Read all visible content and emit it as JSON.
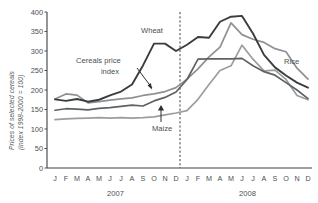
{
  "chart_data": {
    "type": "line",
    "title": "",
    "ylabel_line1": "Prices of selected cereals",
    "ylabel_line2": "(index 1998-2000 = 100)",
    "xlabel": "",
    "ylim": [
      0,
      400
    ],
    "yticks": [
      0,
      50,
      100,
      150,
      200,
      250,
      300,
      350,
      400
    ],
    "ytick_labels": [
      "0",
      "50",
      "100",
      "150",
      "200",
      "250",
      "300",
      "350",
      "400"
    ],
    "grid": false,
    "legend_position": "inline-annotations",
    "x": [
      "J",
      "F",
      "M",
      "A",
      "M",
      "J",
      "J",
      "A",
      "S",
      "O",
      "N",
      "D",
      "J",
      "F",
      "M",
      "A",
      "M",
      "J",
      "J",
      "A",
      "S",
      "O",
      "N",
      "D"
    ],
    "year_groups": [
      {
        "label": "2007",
        "start_index": 0,
        "end_index": 11
      },
      {
        "label": "2008",
        "start_index": 12,
        "end_index": 23
      }
    ],
    "annotations": [
      {
        "id": "wheat-label",
        "text": "Wheat"
      },
      {
        "id": "cereals-price-index-label",
        "text": "Cereals price index"
      },
      {
        "id": "maize-label",
        "text": "Maize"
      },
      {
        "id": "rice-label",
        "text": "Rice"
      },
      {
        "id": "year-divider",
        "text": ""
      }
    ],
    "series": [
      {
        "name": "Wheat",
        "color": "#3a3d3f",
        "values": [
          176,
          172,
          177,
          170,
          175,
          186,
          196,
          214,
          263,
          319,
          319,
          300,
          316,
          336,
          334,
          375,
          388,
          390,
          345,
          290,
          258,
          237,
          219,
          206
        ]
      },
      {
        "name": "Rice",
        "color": "#8e9092",
        "values": [
          177,
          190,
          187,
          167,
          170,
          174,
          177,
          180,
          186,
          190,
          196,
          206,
          228,
          254,
          285,
          310,
          372,
          342,
          330,
          322,
          306,
          298,
          256,
          228
        ]
      },
      {
        "name": "Cereals price index",
        "color": "#5e6264",
        "values": [
          148,
          152,
          151,
          149,
          153,
          155,
          158,
          161,
          159,
          172,
          181,
          195,
          227,
          279,
          280,
          280,
          280,
          281,
          262,
          247,
          238,
          219,
          200,
          178
        ]
      },
      {
        "name": "Maize",
        "color": "#9b9d9f",
        "values": [
          124,
          126,
          127,
          128,
          129,
          128,
          129,
          128,
          129,
          131,
          136,
          141,
          147,
          176,
          214,
          250,
          262,
          315,
          279,
          249,
          251,
          227,
          186,
          175
        ]
      }
    ]
  }
}
